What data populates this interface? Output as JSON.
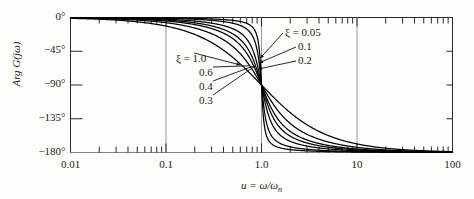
{
  "figure": {
    "y_axis_label": "Arg G(jω)",
    "x_axis_label": "u = ω/ωn",
    "x_axis_label_main": "u = ω/ω",
    "x_axis_label_sub": "n",
    "axis_color": "#2a2a2a",
    "curve_color": "#000000",
    "grid_color": "#8d8d8d",
    "background": "#fdfdfb"
  },
  "y_ticks": [
    {
      "label": "0°",
      "value": 0
    },
    {
      "label": "−45°",
      "value": -45
    },
    {
      "label": "−90°",
      "value": -90
    },
    {
      "label": "−135°",
      "value": -135
    },
    {
      "label": "−180°",
      "value": -180
    }
  ],
  "x_ticks": [
    {
      "label": "0.01",
      "value": 0.01
    },
    {
      "label": "0.1",
      "value": 0.1
    },
    {
      "label": "1.0",
      "value": 1.0
    },
    {
      "label": "10",
      "value": 10
    },
    {
      "label": "100",
      "value": 100
    }
  ],
  "callouts_left": [
    {
      "text": "ξ = 1.0",
      "zeta": 1.0
    },
    {
      "text": "0.6",
      "zeta": 0.6
    },
    {
      "text": "0.4",
      "zeta": 0.4
    },
    {
      "text": "0.3",
      "zeta": 0.3
    }
  ],
  "callouts_right": [
    {
      "text": "ξ = 0.05",
      "zeta": 0.05
    },
    {
      "text": "0.1",
      "zeta": 0.1
    },
    {
      "text": "0.2",
      "zeta": 0.2
    }
  ],
  "chart_data": {
    "type": "line",
    "title": "",
    "xlabel": "u = ω/ωn",
    "ylabel": "Arg G(jω)",
    "xscale": "log",
    "xlim": [
      0.01,
      100
    ],
    "ylim": [
      -180,
      0
    ],
    "grid": true,
    "legend_position": "inline-callouts",
    "formula": "Arg G = -atan2(2*zeta*u, 1-u^2)  (degrees, continuous to -180)",
    "series": [
      {
        "name": "ξ = 0.05",
        "zeta": 0.05
      },
      {
        "name": "ξ = 0.1",
        "zeta": 0.1
      },
      {
        "name": "ξ = 0.2",
        "zeta": 0.2
      },
      {
        "name": "ξ = 0.3",
        "zeta": 0.3
      },
      {
        "name": "ξ = 0.4",
        "zeta": 0.4
      },
      {
        "name": "ξ = 0.6",
        "zeta": 0.6
      },
      {
        "name": "ξ = 1.0",
        "zeta": 1.0
      }
    ],
    "sample_x": [
      0.01,
      0.1,
      0.2,
      0.5,
      0.8,
      0.9,
      1.0,
      1.1,
      1.25,
      2.0,
      5.0,
      10,
      100
    ],
    "sample_values": {
      "0.05": [
        -0.06,
        -0.58,
        -1.19,
        -3.81,
        -12.68,
        -27.8,
        -90,
        -152.4,
        -167.9,
        -176.2,
        -178.8,
        -179.4,
        -179.9
      ],
      "0.1": [
        -0.12,
        -1.15,
        -2.38,
        -7.59,
        -24.6,
        -46.4,
        -90,
        -133.6,
        -161.2,
        -172.4,
        -177.6,
        -178.8,
        -179.9
      ],
      "0.2": [
        -0.23,
        -2.31,
        -4.76,
        -14.93,
        -41.6,
        -64.9,
        -90,
        -115.1,
        -143.4,
        -165.1,
        -175.2,
        -177.7,
        -179.8
      ],
      "0.3": [
        -0.35,
        -3.47,
        -7.13,
        -21.8,
        -53.1,
        -74.5,
        -90,
        -105.5,
        -131.7,
        -158.2,
        -172.9,
        -176.5,
        -179.7
      ],
      "0.4": [
        -0.46,
        -4.63,
        -9.46,
        -28.1,
        -60.6,
        -79.6,
        -90,
        -100.4,
        -123.1,
        -151.9,
        -170.6,
        -175.3,
        -179.5
      ],
      "0.6": [
        -0.69,
        -6.95,
        -14.0,
        -38.7,
        -69.4,
        -85.0,
        -90,
        -95.0,
        -110.6,
        -141.3,
        -166.2,
        -173.0,
        -179.3
      ],
      "1.0": [
        -1.15,
        -11.4,
        -22.6,
        -53.1,
        -77.3,
        -89.5,
        -90,
        -90.5,
        -102.7,
        -126.9,
        -157.4,
        -168.6,
        -178.9
      ]
    }
  }
}
